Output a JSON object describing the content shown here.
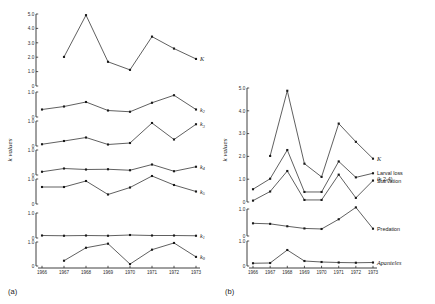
{
  "figure": {
    "caption_a": "(a)",
    "caption_b": "(b)",
    "ylabel": "k values"
  },
  "chart_data": [
    {
      "type": "line",
      "panel": "a",
      "title": "(a)",
      "xlabel": "",
      "ylabel": "k values",
      "x": [
        1966,
        1967,
        1968,
        1969,
        1970,
        1971,
        1972,
        1973
      ],
      "grid": false,
      "legend": "inline-right",
      "subplots": [
        {
          "name": "K",
          "label": "K",
          "ylim": [
            0,
            5.0
          ],
          "yticks": [
            0,
            1.0,
            2.0,
            3.0,
            4.0,
            5.0
          ],
          "yticklabels": [
            "0",
            "1.0",
            "2.0",
            "3.0",
            "4.0",
            "5.0"
          ],
          "x": [
            1967,
            1968,
            1969,
            1970,
            1971,
            1972,
            1973
          ],
          "values": [
            2.02,
            4.92,
            1.68,
            1.12,
            3.43,
            2.6,
            1.88
          ]
        },
        {
          "name": "k2",
          "label": "k₂",
          "ylim": [
            0,
            1.0
          ],
          "yticks": [
            0,
            1.0
          ],
          "yticklabels": [
            "0",
            "1.0"
          ],
          "x": [
            1966,
            1967,
            1968,
            1969,
            1970,
            1971,
            1972,
            1973
          ],
          "values": [
            0.3,
            0.42,
            0.6,
            0.26,
            0.21,
            0.57,
            0.87,
            0.3
          ]
        },
        {
          "name": "k3",
          "label": "k₃",
          "ylim": [
            0,
            1.0
          ],
          "yticks": [
            0,
            1.0
          ],
          "yticklabels": [
            "0",
            "1.0"
          ],
          "x": [
            1966,
            1967,
            1968,
            1969,
            1970,
            1971,
            1972,
            1973
          ],
          "values": [
            0.07,
            0.2,
            0.34,
            0.06,
            0.12,
            0.92,
            0.26,
            0.87
          ]
        },
        {
          "name": "k4",
          "label": "k₄",
          "ylim": [
            0,
            1.0
          ],
          "yticks": [
            0,
            1.0
          ],
          "yticklabels": [
            "0",
            "1.0"
          ],
          "x": [
            1966,
            1967,
            1968,
            1969,
            1970,
            1971,
            1972,
            1973
          ],
          "values": [
            0.13,
            0.26,
            0.22,
            0.23,
            0.19,
            0.42,
            0.15,
            0.33
          ]
        },
        {
          "name": "k5",
          "label": "k₅",
          "ylim": [
            0,
            1.0
          ],
          "yticks": [
            0,
            1.0
          ],
          "yticklabels": [
            "0",
            "1.0"
          ],
          "x": [
            1966,
            1967,
            1968,
            1969,
            1970,
            1971,
            1972,
            1973
          ],
          "values": [
            0.68,
            0.68,
            0.92,
            0.38,
            0.66,
            1.12,
            0.76,
            0.5
          ]
        },
        {
          "name": "k1",
          "label": "k₁",
          "ylim": [
            0,
            1.0
          ],
          "yticks": [
            0,
            1.0
          ],
          "yticklabels": [
            "0",
            "1.0"
          ],
          "x": [
            1966,
            1967,
            1968,
            1969,
            1970,
            1971,
            1972,
            1973
          ],
          "values": [
            0.1,
            0.09,
            0.1,
            0.09,
            0.12,
            0.1,
            0.1,
            0.09
          ]
        },
        {
          "name": "k0",
          "label": "k₀",
          "ylim": [
            0,
            1.0
          ],
          "yticks": [
            0,
            1.0
          ],
          "yticklabels": [
            "0",
            "1.0"
          ],
          "x": [
            1967,
            1968,
            1969,
            1970,
            1971,
            1972,
            1973
          ],
          "values": [
            0.22,
            0.76,
            0.93,
            0.08,
            0.68,
            0.96,
            0.38
          ]
        }
      ]
    },
    {
      "type": "line",
      "panel": "b",
      "title": "(b)",
      "xlabel": "",
      "ylabel": "k values",
      "x": [
        1966,
        1967,
        1968,
        1969,
        1970,
        1971,
        1972,
        1973
      ],
      "grid": false,
      "legend": "inline-right",
      "subplots": [
        {
          "name": "main",
          "ylim": [
            0,
            5.0
          ],
          "yticks": [
            0,
            1.0,
            2.0,
            3.0,
            4.0,
            5.0
          ],
          "yticklabels": [
            "0",
            "1.0",
            "2.0",
            "3.0",
            "4.0",
            "5.0"
          ],
          "series": [
            {
              "name": "K",
              "label": "K",
              "x": [
                1967,
                1968,
                1969,
                1970,
                1971,
                1972,
                1973
              ],
              "values": [
                2.02,
                4.88,
                1.68,
                1.1,
                3.44,
                2.64,
                1.9
              ]
            },
            {
              "name": "Larval loss",
              "label": "Larval loss",
              "sublabel": "(k 2-4)",
              "x": [
                1966,
                1967,
                1968,
                1969,
                1970,
                1971,
                1972,
                1973
              ],
              "values": [
                0.56,
                1.02,
                2.28,
                0.44,
                0.44,
                1.78,
                1.08,
                1.26
              ]
            },
            {
              "name": "Starvation",
              "label": "Starvation",
              "x": [
                1966,
                1967,
                1968,
                1969,
                1970,
                1971,
                1972,
                1973
              ],
              "values": [
                0.06,
                0.46,
                1.36,
                0.09,
                0.09,
                1.2,
                0.18,
                0.94
              ]
            }
          ]
        },
        {
          "name": "Predation",
          "label": "Predation",
          "ylim": [
            0,
            1.0
          ],
          "yticks": [
            0,
            1.0
          ],
          "yticklabels": [
            "0",
            "1.0"
          ],
          "x": [
            1966,
            1967,
            1968,
            1969,
            1970,
            1971,
            1972,
            1973
          ],
          "values": [
            0.47,
            0.45,
            0.36,
            0.28,
            0.26,
            0.62,
            1.06,
            0.27
          ]
        },
        {
          "name": "Apanteles",
          "label": "Apanteles",
          "ylim": [
            0,
            1.0
          ],
          "yticks": [
            0,
            1.0
          ],
          "yticklabels": [
            "0",
            "1.0"
          ],
          "x": [
            1966,
            1967,
            1968,
            1969,
            1970,
            1971,
            1972,
            1973
          ],
          "values": [
            0.11,
            0.12,
            0.64,
            0.2,
            0.16,
            0.14,
            0.13,
            0.14
          ]
        }
      ]
    }
  ]
}
